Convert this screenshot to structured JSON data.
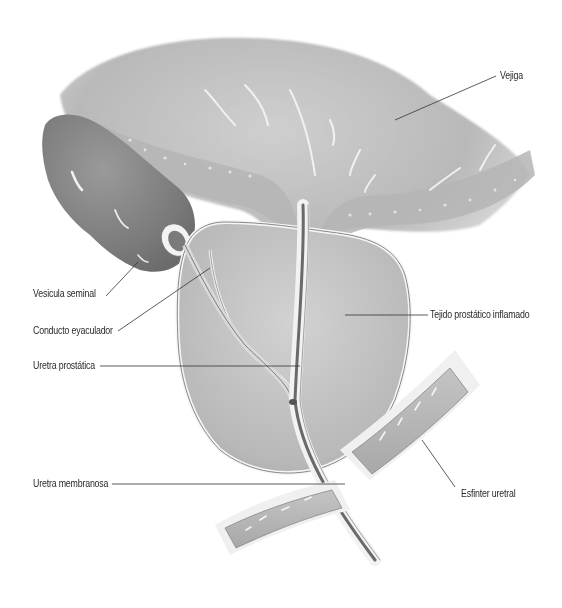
{
  "figure": {
    "style": "grayscale anatomical illustration",
    "colors": {
      "background": "#ffffff",
      "tissue_light": "#d8d8d8",
      "tissue_mid": "#a8a8a8",
      "tissue_dark": "#6e6e6e",
      "leader_line": "#333333",
      "label_text": "#2a2a2a"
    }
  },
  "labels": {
    "vejiga": "Vejiga",
    "vesicula_seminal": "Vesicula seminal",
    "conducto_eyaculador": "Conducto eyaculador",
    "tejido_prostatico": "Tejido prostático inflamado",
    "uretra_prostatica": "Uretra prostática",
    "uretra_membranosa": "Uretra membranosa",
    "esfinter_uretral": "Esfinter uretral"
  }
}
